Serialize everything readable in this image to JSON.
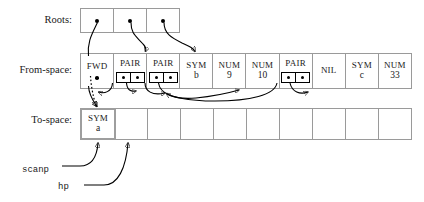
{
  "figure": {
    "type": "memory-layout-diagram"
  },
  "rows": {
    "roots": {
      "label": "Roots:",
      "cells": [
        {
          "kind": "pointer",
          "icon": "dot"
        },
        {
          "kind": "pointer",
          "icon": "dot"
        },
        {
          "kind": "pointer",
          "icon": "dot"
        }
      ]
    },
    "from_space": {
      "label": "From-space:",
      "cells": [
        {
          "kind": "fwd",
          "tag": "FWD",
          "value": "",
          "icon": "dot"
        },
        {
          "kind": "pair",
          "tag": "PAIR",
          "value": "",
          "icon": "pair-slots"
        },
        {
          "kind": "pair",
          "tag": "PAIR",
          "value": "",
          "icon": "pair-slots"
        },
        {
          "kind": "sym",
          "tag": "SYM",
          "value": "b"
        },
        {
          "kind": "num",
          "tag": "NUM",
          "value": "9"
        },
        {
          "kind": "num",
          "tag": "NUM",
          "value": "10"
        },
        {
          "kind": "pair",
          "tag": "PAIR",
          "value": "",
          "icon": "pair-slots"
        },
        {
          "kind": "nil",
          "tag": "NIL",
          "value": ""
        },
        {
          "kind": "sym",
          "tag": "SYM",
          "value": "c"
        },
        {
          "kind": "num",
          "tag": "NUM",
          "value": "33"
        }
      ]
    },
    "to_space": {
      "label": "To-space:",
      "cells": [
        {
          "kind": "sym",
          "tag": "SYM",
          "value": "a",
          "filled": true
        },
        {
          "kind": "empty",
          "tag": "",
          "value": ""
        },
        {
          "kind": "empty",
          "tag": "",
          "value": ""
        },
        {
          "kind": "empty",
          "tag": "",
          "value": ""
        },
        {
          "kind": "empty",
          "tag": "",
          "value": ""
        },
        {
          "kind": "empty",
          "tag": "",
          "value": ""
        },
        {
          "kind": "empty",
          "tag": "",
          "value": ""
        },
        {
          "kind": "empty",
          "tag": "",
          "value": ""
        },
        {
          "kind": "empty",
          "tag": "",
          "value": ""
        },
        {
          "kind": "empty",
          "tag": "",
          "value": ""
        }
      ]
    }
  },
  "pointers": {
    "scanp": "scanp",
    "hp": "hp"
  },
  "colors": {
    "stroke": "#000000",
    "cell_border": "#9a9a9a",
    "highlight_border": "#9e9e9e",
    "background": "#ffffff",
    "text": "#1a1a1a"
  }
}
